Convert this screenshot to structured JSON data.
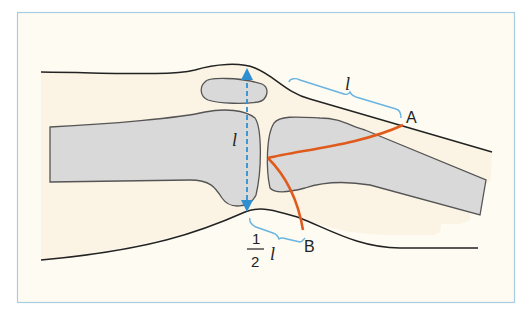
{
  "diagram": {
    "labels": {
      "point_a": "A",
      "point_b": "B",
      "length_top": "l",
      "length_vertical": "l",
      "half_numerator": "1",
      "half_denominator": "2",
      "half_var": "l"
    },
    "colors": {
      "frame_border": "#a8cde0",
      "background": "#fdfbf2",
      "skin_fill": "#fbf3e3",
      "bone_fill": "#d9d9d9",
      "outline": "#222222",
      "bone_outline": "#555555",
      "measure_blue": "#2f8fd0",
      "bracket_blue": "#6ab4e0",
      "crease_orange": "#e05a1c"
    }
  }
}
